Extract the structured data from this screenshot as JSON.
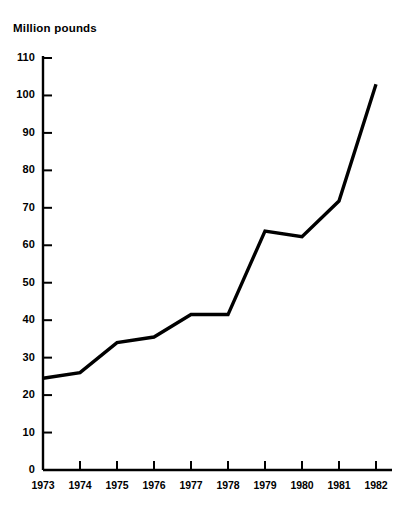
{
  "chart_data": {
    "type": "line",
    "title": "Million pounds",
    "xlabel": "",
    "ylabel": "Million pounds",
    "categories": [
      "1973",
      "1974",
      "1975",
      "1976",
      "1977",
      "1978",
      "1979",
      "1980",
      "1981",
      "1982"
    ],
    "values": [
      24.5,
      26,
      34,
      35.5,
      41.5,
      41.5,
      63.8,
      62.3,
      71.8,
      103
    ],
    "series": [
      {
        "name": "Million pounds",
        "values": [
          24.5,
          26,
          34,
          35.5,
          41.5,
          41.5,
          63.8,
          62.3,
          71.8,
          103
        ]
      }
    ],
    "ylim": [
      0,
      110
    ],
    "ytick_values": [
      0,
      10,
      20,
      30,
      40,
      50,
      60,
      70,
      80,
      90,
      100,
      110
    ],
    "ytick_labels": [
      "0",
      "10",
      "20",
      "30",
      "40",
      "50",
      "60",
      "70",
      "80",
      "90",
      "100",
      "110"
    ],
    "xtick_labels": [
      "1973",
      "1974",
      "1975",
      "1976",
      "1977",
      "1978",
      "1979",
      "1980",
      "1981",
      "1982"
    ],
    "grid": false,
    "legend": "none",
    "line_color": "#000000",
    "axis_color": "#000000",
    "background_color": "#ffffff"
  }
}
